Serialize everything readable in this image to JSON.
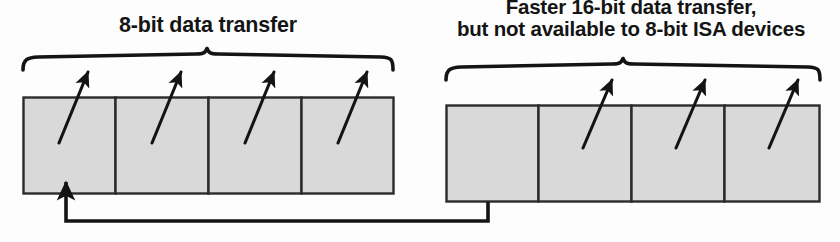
{
  "diagram": {
    "title_left": "8-bit data transfer",
    "title_right_line1": "Faster 16-bit data transfer,",
    "title_right_line2": "but not available to 8-bit ISA devices",
    "colors": {
      "box_fill": "#d9d9d9",
      "box_stroke": "#2b2b2b",
      "ink": "#141414",
      "background": "#fdfdfd"
    },
    "groups": [
      {
        "name": "low-byte-group",
        "label": "8-bit data transfer",
        "cells": [
          {
            "label": "0"
          },
          {
            "label": "1"
          },
          {
            "label": "2"
          },
          {
            "label": "3"
          }
        ]
      },
      {
        "name": "high-byte-group",
        "label": "Faster 16-bit data transfer, but not available to 8-bit ISA devices",
        "cells": [
          {
            "label": "4"
          },
          {
            "label": "5"
          },
          {
            "label": "6"
          },
          {
            "label": "7"
          }
        ]
      }
    ],
    "feedback": {
      "name": "wrap-around-connector",
      "from_cell": "4",
      "to_cell": "0"
    }
  }
}
